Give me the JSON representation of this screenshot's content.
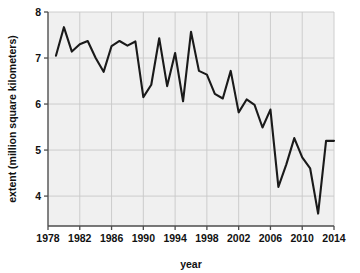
{
  "chart_data": {
    "type": "line",
    "title": "",
    "xlabel": "year",
    "ylabel": "extent (million square kilometers)",
    "xlim": [
      1978,
      2014
    ],
    "ylim": [
      3.35,
      8.0
    ],
    "xticks": [
      1978,
      1982,
      1986,
      1990,
      1994,
      1998,
      2002,
      2006,
      2010,
      2014
    ],
    "xticklabels": [
      "1978",
      "1982",
      "1986",
      "1990",
      "1994",
      "1998",
      "2002",
      "2006",
      "2010",
      "2014"
    ],
    "yticks": [
      4,
      5,
      6,
      7,
      8
    ],
    "yticklabels": [
      "4",
      "5",
      "6",
      "7",
      "8"
    ],
    "grid": true,
    "legend": "none",
    "series": [
      {
        "name": "sea ice extent",
        "color": "#1a1a1a",
        "x": [
          1979,
          1980,
          1981,
          1982,
          1983,
          1984,
          1985,
          1986,
          1987,
          1988,
          1989,
          1990,
          1991,
          1992,
          1993,
          1994,
          1995,
          1996,
          1997,
          1998,
          1999,
          2000,
          2001,
          2002,
          2003,
          2004,
          2005,
          2006,
          2007,
          2008,
          2009,
          2010,
          2011,
          2012,
          2013,
          2014
        ],
        "values": [
          7.05,
          7.67,
          7.14,
          7.3,
          7.37,
          7.0,
          6.7,
          7.26,
          7.37,
          7.27,
          7.36,
          6.15,
          6.42,
          7.43,
          6.39,
          7.11,
          6.06,
          7.57,
          6.72,
          6.64,
          6.22,
          6.12,
          6.72,
          5.82,
          6.1,
          5.98,
          5.49,
          5.88,
          4.2,
          4.69,
          5.26,
          4.84,
          4.6,
          3.62,
          5.2,
          5.2
        ]
      }
    ]
  },
  "axes": {
    "y_axis_name": "y-axis",
    "x_axis_name": "x-axis"
  },
  "style": {
    "plot_background": "#f0f0f0",
    "grid_color": "#c8c8c8",
    "axis_color": "#4d4d4d",
    "line_color": "#1a1a1a",
    "page_background": "#ffffff"
  }
}
